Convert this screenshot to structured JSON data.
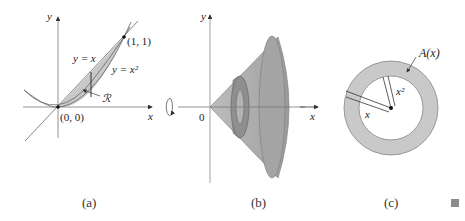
{
  "figure": {
    "panels": [
      {
        "id": "a",
        "caption": "(a)",
        "axes": {
          "x_label": "x",
          "y_label": "y"
        },
        "curves": [
          {
            "label": "y = x",
            "equation": "y=x"
          },
          {
            "label": "y = x²",
            "equation": "y=x^2"
          }
        ],
        "points": [
          {
            "label": "(1, 1)"
          },
          {
            "label": "(0, 0)"
          }
        ],
        "region_label": "ℛ"
      },
      {
        "id": "b",
        "caption": "(b)",
        "axes": {
          "x_label": "x",
          "y_label": "y",
          "origin_label": "0"
        },
        "description": "Solid of revolution about x-axis with washer cross-section"
      },
      {
        "id": "c",
        "caption": "(c)",
        "area_label": "A(x)",
        "outer_radius_label": "x",
        "inner_radius_label": "x²"
      }
    ],
    "end_marker": "■",
    "colors": {
      "region_fill": "#c8c8c8",
      "solid_fill": "#a9a9a9",
      "ring_fill": "#c9c9c9",
      "line": "#555555",
      "axis": "#888888"
    }
  }
}
